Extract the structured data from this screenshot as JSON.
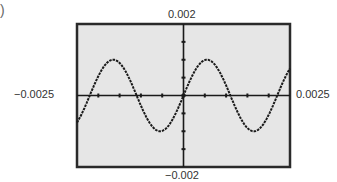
{
  "figure": {
    "part_label": ")"
  },
  "window": {
    "xmin_label": "−0.0025",
    "xmax_label": "0.0025",
    "ymin_label": "−0.002",
    "ymax_label": "0.002"
  },
  "colors": {
    "background": "#e6e6e6",
    "frame": "#2a2a2a",
    "curve": "#1a1a1a",
    "axis": "#1a1a1a"
  },
  "chart_data": {
    "type": "line",
    "title": "",
    "xlabel": "",
    "ylabel": "",
    "xlim": [
      -0.0025,
      0.0025
    ],
    "ylim": [
      -0.002,
      0.002
    ],
    "grid": false,
    "legend": null,
    "x_tick_labels": [
      "-0.0025",
      "0.0025"
    ],
    "y_tick_labels": [
      "-0.002",
      "0.002"
    ],
    "x_tick_spacing": 0.0005,
    "y_tick_spacing": 0.0005,
    "series": [
      {
        "name": "y = A sin(2πx/T)",
        "amplitude": 0.001,
        "period": 0.0022,
        "phase": 0,
        "x": [
          -0.0025,
          -0.0022,
          -0.00165,
          -0.0011,
          -0.00055,
          0,
          0.00055,
          0.0011,
          0.00165,
          0.0022,
          0.0025
        ],
        "y": [
          -0.0007,
          0,
          0.001,
          0,
          -0.001,
          0,
          0.001,
          0,
          -0.001,
          0,
          0.0007
        ]
      }
    ]
  }
}
